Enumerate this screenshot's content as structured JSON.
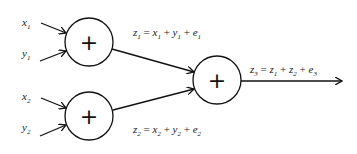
{
  "diagram": {
    "inputs": [
      {
        "var": "x",
        "sub": "1"
      },
      {
        "var": "y",
        "sub": "1"
      },
      {
        "var": "x",
        "sub": "2"
      },
      {
        "var": "y",
        "sub": "2"
      }
    ],
    "nodes": [
      {
        "id": "sum1",
        "symbol": "+"
      },
      {
        "id": "sum2",
        "symbol": "+"
      },
      {
        "id": "sum3",
        "symbol": "+"
      }
    ],
    "equations": {
      "z1": {
        "lhs": "z",
        "lhs_sub": "1",
        "eq": " = ",
        "t1": "x",
        "t1_sub": "1",
        "op1": " + ",
        "t2": "y",
        "t2_sub": "1",
        "op2": " + ",
        "t3": "e",
        "t3_sub": "1"
      },
      "z2": {
        "lhs": "z",
        "lhs_sub": "2",
        "eq": " = ",
        "t1": "x",
        "t1_sub": "2",
        "op1": " + ",
        "t2": "y",
        "t2_sub": "2",
        "op2": " + ",
        "t3": "e",
        "t3_sub": "2"
      },
      "z3": {
        "lhs": "z",
        "lhs_sub": "3",
        "eq": " = ",
        "t1": "z",
        "t1_sub": "1",
        "op1": " + ",
        "t2": "z",
        "t2_sub": "2",
        "op2": " + ",
        "t3": "e",
        "t3_sub": "3"
      }
    }
  }
}
